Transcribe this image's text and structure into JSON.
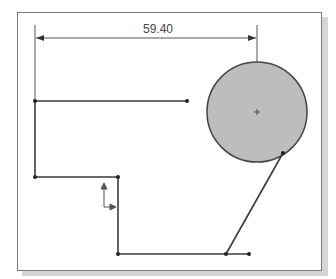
{
  "diagram": {
    "type": "cad-sketch",
    "dimension": {
      "label": "59.40",
      "units": "mm"
    },
    "colors": {
      "line": "#3a3a3a",
      "circle_fill": "#bdbdbd",
      "frame": "#7a7a7a",
      "shadow": "#d6d6d6"
    },
    "circle": {
      "cx": 257,
      "cy": 112,
      "r": 50
    },
    "points": [
      {
        "x": 35,
        "y": 101
      },
      {
        "x": 187,
        "y": 101
      },
      {
        "x": 35,
        "y": 177
      },
      {
        "x": 118,
        "y": 177
      },
      {
        "x": 118,
        "y": 254
      },
      {
        "x": 226,
        "y": 254
      },
      {
        "x": 249,
        "y": 254
      },
      {
        "x": 283,
        "y": 153
      }
    ]
  }
}
